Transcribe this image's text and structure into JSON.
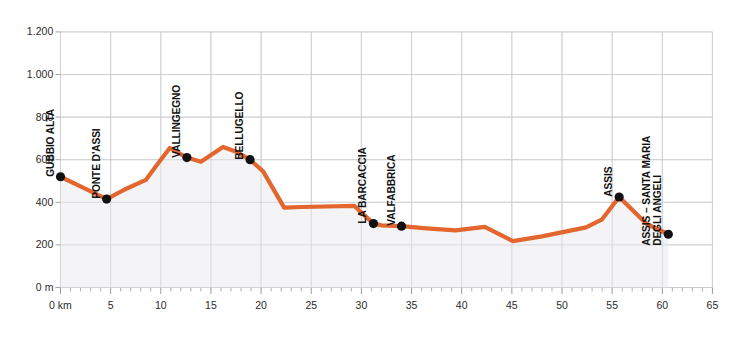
{
  "chart_data": {
    "type": "area",
    "title": "",
    "subtitle": "",
    "xlabel": "",
    "ylabel": "",
    "xlim": [
      0,
      65
    ],
    "ylim": [
      0,
      1200
    ],
    "grid": true,
    "legend": "none",
    "line_color": "#E3662F",
    "fill_color": "#F3F3F6",
    "marker_color": "#111111",
    "x_unit_label": "0 km",
    "y_unit_label": "0 m",
    "y_ticks": [
      "0 m",
      "200",
      "400",
      "600",
      "800",
      "1.000",
      "1.200"
    ],
    "y_tick_values": [
      0,
      200,
      400,
      600,
      800,
      1000,
      1200
    ],
    "x_ticks": [
      "0 km",
      "5",
      "10",
      "15",
      "20",
      "25",
      "30",
      "35",
      "40",
      "45",
      "50",
      "55",
      "60",
      "65"
    ],
    "x_tick_values": [
      0,
      5,
      10,
      15,
      20,
      25,
      30,
      35,
      40,
      45,
      50,
      55,
      60,
      65
    ],
    "x": [
      0,
      2.2,
      4.6,
      6.4,
      8.5,
      10.0,
      10.9,
      12.6,
      14.0,
      16.2,
      17.4,
      18.9,
      20.2,
      22.3,
      24.0,
      29.3,
      31.2,
      32.0,
      34.0,
      36.5,
      39.4,
      42.3,
      45.1,
      48.0,
      52.4,
      54.0,
      55.7,
      58.4,
      60.6
    ],
    "y": [
      520,
      470,
      415,
      460,
      505,
      600,
      655,
      610,
      590,
      660,
      640,
      600,
      545,
      375,
      378,
      383,
      300,
      292,
      288,
      278,
      268,
      285,
      218,
      240,
      282,
      320,
      425,
      300,
      250
    ],
    "series": [
      {
        "name": "Elevation profile",
        "values": [
          520,
          470,
          415,
          460,
          505,
          600,
          655,
          610,
          590,
          660,
          640,
          600,
          545,
          375,
          378,
          383,
          300,
          292,
          288,
          278,
          268,
          285,
          218,
          240,
          282,
          320,
          425,
          300,
          250
        ]
      }
    ],
    "markers": [
      {
        "label": "GUBBIO ALTA",
        "x": 0.0,
        "y": 520,
        "lines": [
          "GUBBIO ALTA"
        ]
      },
      {
        "label": "PONTE D'ASSI",
        "x": 4.6,
        "y": 415,
        "lines": [
          "PONTE D'ASSI"
        ]
      },
      {
        "label": "VALLINGEGNO",
        "x": 12.6,
        "y": 610,
        "lines": [
          "VALLINGEGNO"
        ]
      },
      {
        "label": "BELLUGELLO",
        "x": 18.9,
        "y": 600,
        "lines": [
          "BELLUGELLO"
        ]
      },
      {
        "label": "LA BARCACCIA",
        "x": 31.2,
        "y": 300,
        "lines": [
          "LA BARCACCIA"
        ]
      },
      {
        "label": "VALFABBRICA",
        "x": 34.0,
        "y": 288,
        "lines": [
          "VALFABBRICA"
        ]
      },
      {
        "label": "ASSIS",
        "x": 55.7,
        "y": 425,
        "lines": [
          "ASSIS"
        ]
      },
      {
        "label": "ASSIS – SANTA MARIA DEGLI ANGELI",
        "x": 60.6,
        "y": 250,
        "lines": [
          "ASSIS – SANTA MARIA",
          "DEGLI ANGELI"
        ]
      }
    ],
    "annotations": []
  }
}
